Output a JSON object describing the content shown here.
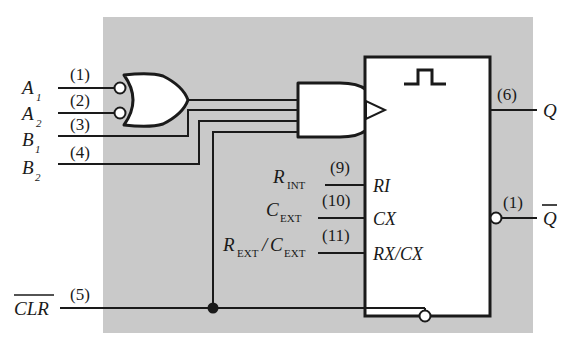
{
  "figure": {
    "type": "logic-diagram",
    "background_color": "#c9c9c9",
    "page_color": "#ffffff",
    "line_color": "#1a1a1a"
  },
  "inputs": [
    {
      "name": "A",
      "subscript": "1",
      "pin": "(1)",
      "inverted": true
    },
    {
      "name": "A",
      "subscript": "2",
      "pin": "(2)",
      "inverted": true
    },
    {
      "name": "B",
      "subscript": "1",
      "pin": "(3)",
      "inverted": false
    },
    {
      "name": "B",
      "subscript": "2",
      "pin": "(4)",
      "inverted": false
    }
  ],
  "clear": {
    "label": "CLR",
    "overbar": true,
    "pin": "(5)"
  },
  "timing_inputs": [
    {
      "name": "R",
      "subscript": "INT",
      "pin": "(9)",
      "block_label": "RI"
    },
    {
      "name": "C",
      "subscript": "EXT",
      "pin": "(10)",
      "block_label": "CX"
    },
    {
      "name": "R",
      "subscript": "EXT",
      "name2": "C",
      "subscript2": "EXT",
      "separator": "/",
      "pin": "(11)",
      "block_label": "RX/CX"
    }
  ],
  "outputs": [
    {
      "name": "Q",
      "overbar": false,
      "pin": "(6)"
    },
    {
      "name": "Q",
      "overbar": true,
      "pin": "(1)",
      "inverted": true
    }
  ],
  "gates": {
    "or_gate": {
      "name": "nor-gate",
      "inputs": 2,
      "input_bubbles": 2
    },
    "and_gate": {
      "name": "and-gate",
      "inputs": 3,
      "input_bubbles": 0
    }
  },
  "block": {
    "name": "one-shot-block",
    "symbol": "pulse",
    "trigger": "edge-triggered",
    "clear_bubble": true
  }
}
